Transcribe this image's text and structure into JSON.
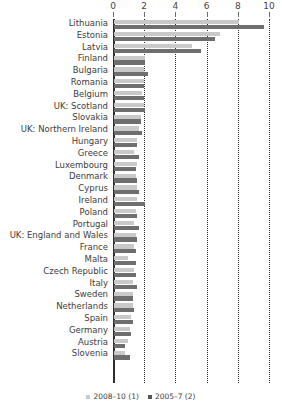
{
  "chart_data": {
    "type": "bar",
    "orientation": "horizontal",
    "title": "",
    "subtitle": "",
    "xlabel": "",
    "ylabel": "",
    "xlim": [
      0,
      10
    ],
    "xticks": [
      0,
      2,
      4,
      6,
      8,
      10
    ],
    "xtick_labels": [
      "0",
      "2",
      "4",
      "6",
      "8",
      "10"
    ],
    "grid": "vertical dotted gridlines at each tick",
    "legend_position": "bottom-center",
    "categories": [
      "Lithuania",
      "Estonia",
      "Latvia",
      "Finland",
      "Bulgaria",
      "Romania",
      "Belgium",
      "UK: Scotland",
      "Slovakia",
      "UK: Northern Ireland",
      "Hungary",
      "Greece",
      "Luxembourg",
      "Denmark",
      "Cyprus",
      "Ireland",
      "Poland",
      "Portugal",
      "UK: England and Wales",
      "France",
      "Malta",
      "Czech Republic",
      "Italy",
      "Sweden",
      "Netherlands",
      "Spain",
      "Germany",
      "Austria",
      "Slovenia"
    ],
    "series": [
      {
        "name": "2008-10 (1)",
        "color": "#c9c9c9",
        "values": [
          8.0,
          6.8,
          5.0,
          2.0,
          1.9,
          1.9,
          1.8,
          1.9,
          1.7,
          1.6,
          1.5,
          1.3,
          1.5,
          1.4,
          1.5,
          1.5,
          1.4,
          1.3,
          1.4,
          1.3,
          0.9,
          1.3,
          1.2,
          1.2,
          1.2,
          1.1,
          1.0,
          0.9,
          0.7
        ]
      },
      {
        "name": "2005-7 (2)",
        "color": "#6e6e6e",
        "values": [
          9.6,
          6.5,
          5.6,
          2.0,
          2.2,
          1.9,
          1.9,
          2.0,
          1.7,
          1.8,
          1.5,
          1.6,
          1.4,
          1.5,
          1.6,
          2.0,
          1.5,
          1.6,
          1.5,
          1.4,
          1.4,
          1.4,
          1.5,
          1.2,
          1.3,
          1.2,
          1.1,
          0.7,
          1.0
        ]
      }
    ]
  },
  "legend": {
    "items": [
      {
        "label": "2008–10 (1)"
      },
      {
        "label": "2005–7 (2)"
      }
    ]
  }
}
